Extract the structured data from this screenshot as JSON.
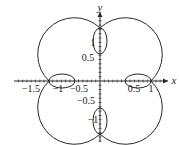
{
  "chart_data": {
    "type": "line",
    "title": "",
    "xlabel": "x",
    "ylabel": "y",
    "xlim": [
      -1.6,
      1.4
    ],
    "ylim": [
      -1.3,
      1.4
    ],
    "grid": false,
    "x_ticks": [
      {
        "value": -1.5,
        "label": "−1.5"
      },
      {
        "value": -1,
        "label": "−1"
      },
      {
        "value": -0.5,
        "label": "−0.5"
      },
      {
        "value": 0.5,
        "label": "0.5"
      },
      {
        "value": 1,
        "label": "1"
      }
    ],
    "y_ticks": [
      {
        "value": 1,
        "label": "1"
      },
      {
        "value": 0.5,
        "label": "0.5"
      },
      {
        "value": -0.5,
        "label": "−0.5"
      },
      {
        "value": -1,
        "label": "−1"
      }
    ],
    "minor_tick_step": 0.1,
    "features": {
      "outer_axis_crossings": [
        [
          1.05,
          0
        ],
        [
          0,
          1.05
        ],
        [
          -1.05,
          0
        ],
        [
          0,
          -1.05
        ]
      ],
      "inner_loops": [
        {
          "axis": "x+",
          "from": 0.55,
          "to": 1.05
        },
        {
          "axis": "x-",
          "from": -1.05,
          "to": -0.55
        },
        {
          "axis": "y+",
          "from": 0.55,
          "to": 1.05
        },
        {
          "axis": "y-",
          "from": -1.05,
          "to": -0.55
        }
      ],
      "outer_max_extent": 1.15
    },
    "series": [
      {
        "name": "polar curve",
        "color": "#2a2a2a"
      }
    ]
  },
  "labels": {
    "x_axis": "x",
    "y_axis": "y",
    "x_ticks": [
      "−1.5",
      "−1",
      "−0.5",
      "0.5",
      "1"
    ],
    "y_ticks": [
      "1",
      "0.5",
      "−0.5",
      "−1"
    ]
  },
  "colors": {
    "stroke": "#2a2a2a",
    "background": "#ffffff"
  }
}
